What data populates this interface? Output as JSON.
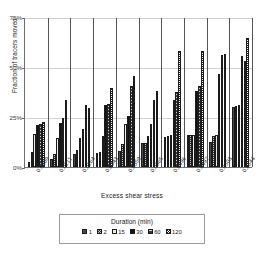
{
  "chart_data": {
    "type": "bar",
    "title": "",
    "xlabel": "Excess shear stress",
    "ylabel": "Fraction of tracers moved",
    "ylim": [
      0,
      75
    ],
    "yticks": [
      "0%",
      "25%",
      "50%",
      "75%"
    ],
    "ytick_values": [
      0,
      25,
      50,
      75
    ],
    "grid": true,
    "legend_position": "bottom",
    "legend_title": "Duration (min)",
    "categories": [
      "0.0209",
      "0.0211",
      "0.0264",
      "0.0343",
      "0.0359",
      "0.0365",
      "0.0496",
      "0.0497",
      "0.0503",
      "0.0644"
    ],
    "series": [
      {
        "name": "1",
        "values": [
          2.5,
          4.0,
          6.5,
          7.0,
          8.0,
          12.0,
          15.0,
          16.0,
          12.5,
          30.0
        ]
      },
      {
        "name": "2",
        "values": [
          7.5,
          6.5,
          8.5,
          7.5,
          11.5,
          12.0,
          15.5,
          16.0,
          15.5,
          30.5
        ]
      },
      {
        "name": "15",
        "values": [
          16.5,
          14.5,
          14.5,
          15.5,
          21.5,
          15.5,
          16.0,
          16.0,
          16.0,
          31.0
        ]
      },
      {
        "name": "30",
        "values": [
          21.0,
          22.0,
          19.0,
          31.0,
          25.5,
          21.5,
          33.5,
          38.0,
          46.5,
          55.5
        ]
      },
      {
        "name": "60",
        "values": [
          21.5,
          24.5,
          31.0,
          31.5,
          40.5,
          33.5,
          37.5,
          40.5,
          56.0,
          53.0
        ]
      },
      {
        "name": "120",
        "values": [
          22.5,
          33.5,
          29.5,
          39.5,
          45.5,
          38.0,
          58.0,
          58.0,
          56.5,
          64.5
        ]
      }
    ],
    "group_separators": 10
  },
  "legend": {
    "title": "Duration (min)",
    "entries": [
      {
        "label": "1",
        "pattern": "solid-dark-gray"
      },
      {
        "label": "2",
        "pattern": "checker-dark"
      },
      {
        "label": "15",
        "pattern": "light-solid"
      },
      {
        "label": "30",
        "pattern": "solid-black"
      },
      {
        "label": "60",
        "pattern": "horizontal-hatch"
      },
      {
        "label": "120",
        "pattern": "checker-white"
      }
    ]
  },
  "colors": {
    "axis": "#6e6e6e",
    "grid": "#d2d2d2",
    "separator": "#555555",
    "text": "#1a1a1a"
  }
}
